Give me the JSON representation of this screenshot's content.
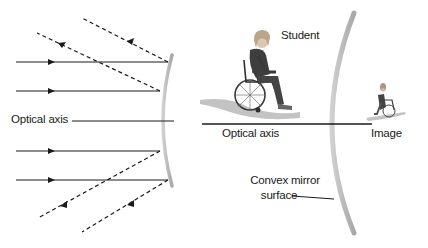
{
  "diagram": {
    "type": "convex-mirror-ray-diagram",
    "labels": {
      "optical_axis_left": "Optical axis",
      "optical_axis_right": "Optical axis",
      "student": "Student",
      "image": "Image",
      "mirror_line1": "Convex mirror",
      "mirror_line2": "surface"
    },
    "colors": {
      "ray": "#1a1a1a",
      "mirror": "#b8b8b8",
      "figure": "#3a3a3a",
      "shadow": "#9a9a9a"
    },
    "rays": {
      "incident": [
        {
          "y": 62,
          "from_x": 16,
          "to_x": 168
        },
        {
          "y": 91,
          "from_x": 16,
          "to_x": 160
        },
        {
          "y": 151,
          "from_x": 16,
          "to_x": 160
        },
        {
          "y": 180,
          "from_x": 16,
          "to_x": 168
        }
      ],
      "reflected": [
        {
          "from": [
            168,
            62
          ],
          "to": [
            82,
            18
          ]
        },
        {
          "from": [
            160,
            91
          ],
          "to": [
            37,
            33
          ]
        },
        {
          "from": [
            160,
            151
          ],
          "to": [
            38,
            218
          ]
        },
        {
          "from": [
            168,
            180
          ],
          "to": [
            82,
            232
          ]
        }
      ]
    }
  }
}
